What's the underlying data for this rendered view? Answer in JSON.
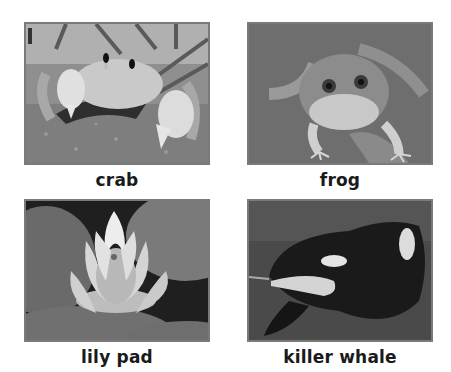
{
  "worksheet": {
    "cards": [
      {
        "id": "crab",
        "label": "crab",
        "image": "crab-photo"
      },
      {
        "id": "frog",
        "label": "frog",
        "image": "frog-photo"
      },
      {
        "id": "lily-pad",
        "label": "lily pad",
        "image": "lily-pad-photo"
      },
      {
        "id": "killer-whale",
        "label": "killer whale",
        "image": "killer-whale-photo"
      }
    ]
  },
  "colors": {
    "background": "#ffffff",
    "photo_border": "#7a7a7a",
    "caption_text": "#1a1a1a"
  }
}
